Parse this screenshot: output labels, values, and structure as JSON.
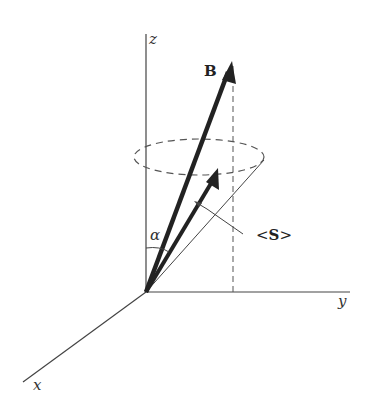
{
  "diagram": {
    "type": "3d-vector-precession",
    "labels": {
      "z_axis": "z",
      "y_axis": "y",
      "x_axis": "x",
      "field_vector": "B",
      "angle": "α",
      "spin_open": "<",
      "spin_symbol": "S",
      "spin_close": ">"
    },
    "colors": {
      "axis": "#444444",
      "vector": "#222222",
      "dashed": "#555555"
    }
  }
}
